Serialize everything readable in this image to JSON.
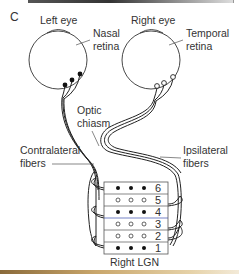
{
  "panel_label": "C",
  "eyes": {
    "left": {
      "title": "Left eye",
      "retina_label_line1": "Nasal",
      "retina_label_line2": "retina",
      "cell_type": "filled"
    },
    "right": {
      "title": "Right eye",
      "retina_label_line1": "Temporal",
      "retina_label_line2": "retina",
      "cell_type": "open"
    }
  },
  "labels": {
    "chiasm_line1": "Optic",
    "chiasm_line2": "chiasm",
    "contralateral_line1": "Contralateral",
    "contralateral_line2": "fibers",
    "ipsilateral_line1": "Ipsilateral",
    "ipsilateral_line2": "fibers"
  },
  "lgn": {
    "title": "Right LGN",
    "layers": [
      {
        "number": "6",
        "type": "filled"
      },
      {
        "number": "5",
        "type": "open"
      },
      {
        "number": "4",
        "type": "filled"
      },
      {
        "number": "3",
        "type": "open"
      },
      {
        "number": "2",
        "type": "open"
      },
      {
        "number": "1",
        "type": "filled"
      }
    ]
  },
  "colors": {
    "line": "#222222",
    "text": "#333333",
    "box_border": "#555555",
    "layer4_divider": "#3a4fb0"
  }
}
